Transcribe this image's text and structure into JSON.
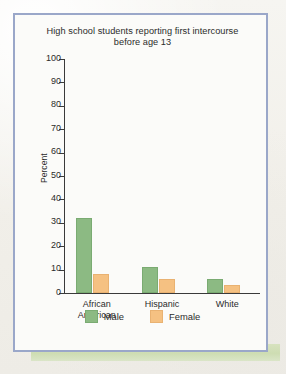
{
  "chart_data": {
    "type": "bar",
    "title": "High school students reporting first intercourse before age 13",
    "title_line1": "High school students reporting first intercourse",
    "title_line2": "before age 13",
    "xlabel": "",
    "ylabel": "Percent",
    "ylim": [
      0,
      100
    ],
    "ytick_step": 10,
    "yticks": [
      100,
      90,
      80,
      70,
      60,
      50,
      40,
      30,
      20,
      10,
      0
    ],
    "grid": false,
    "legend_position": "bottom",
    "categories": [
      "African American",
      "Hispanic",
      "White"
    ],
    "category_lines": [
      [
        "African",
        "American"
      ],
      [
        "Hispanic"
      ],
      [
        "White"
      ]
    ],
    "series": [
      {
        "name": "Male",
        "color": "#8cba83",
        "values": [
          32,
          11,
          6
        ]
      },
      {
        "name": "Female",
        "color": "#f5c182",
        "values": [
          8,
          6,
          3.5
        ]
      }
    ]
  },
  "figure": {
    "frame_color": "#9aa7c9",
    "band_color": "#d6e2bd",
    "background_color": "#fbfbf9"
  }
}
